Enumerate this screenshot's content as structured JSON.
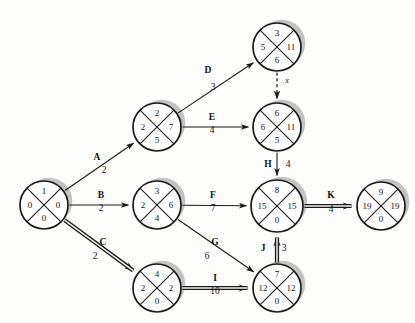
{
  "diagram": {
    "colors": {
      "line": "#1a1a1a",
      "shadow": "#b9b9b9",
      "background": "#fdfdfc",
      "critical": "#3a3a3a"
    },
    "nodes": [
      {
        "id": "1",
        "cx": 44,
        "cy": 205,
        "r": 24,
        "top": "1",
        "left": "0",
        "right": "0",
        "bottom": "0"
      },
      {
        "id": "2",
        "cx": 157,
        "cy": 127,
        "r": 24,
        "top": "2",
        "left": "2",
        "right": "7",
        "bottom": "5"
      },
      {
        "id": "3",
        "cx": 157,
        "cy": 205,
        "r": 24,
        "top": "3",
        "left": "2",
        "right": "6",
        "bottom": "4"
      },
      {
        "id": "4",
        "cx": 157,
        "cy": 288,
        "r": 24,
        "top": "4",
        "left": "2",
        "right": "2",
        "bottom": "0"
      },
      {
        "id": "5",
        "cx": 277,
        "cy": 47,
        "r": 24,
        "top": "3",
        "left": "5",
        "right": "11",
        "bottom": "6"
      },
      {
        "id": "6",
        "cx": 277,
        "cy": 127,
        "r": 24,
        "top": "6",
        "left": "6",
        "right": "11",
        "bottom": "5"
      },
      {
        "id": "8",
        "cx": 277,
        "cy": 206,
        "r": 26,
        "top": "8",
        "left": "15",
        "right": "15",
        "bottom": "0"
      },
      {
        "id": "7",
        "cx": 277,
        "cy": 288,
        "r": 24,
        "top": "7",
        "left": "12",
        "right": "12",
        "bottom": "0"
      },
      {
        "id": "9",
        "cx": 381,
        "cy": 206,
        "r": 24,
        "top": "9",
        "left": "19",
        "right": "19",
        "bottom": "0"
      }
    ],
    "edges": [
      {
        "id": "A",
        "label": "A",
        "duration": "2",
        "from": "1",
        "to": "2",
        "style": "thin",
        "label_x": 97,
        "label_y": 158,
        "dur_x": 104,
        "dur_y": 171
      },
      {
        "id": "B",
        "label": "B",
        "duration": "2",
        "from": "1",
        "to": "3",
        "style": "thin",
        "label_x": 101,
        "label_y": 196,
        "dur_x": 101,
        "dur_y": 209
      },
      {
        "id": "C",
        "label": "C",
        "duration": "2",
        "from": "1",
        "to": "4",
        "style": "critical",
        "label_x": 103,
        "label_y": 243,
        "dur_x": 95,
        "dur_y": 257
      },
      {
        "id": "D",
        "label": "D",
        "duration": "3",
        "from": "2",
        "to": "5",
        "style": "thin",
        "label_x": 208,
        "label_y": 71,
        "dur_x": 213,
        "dur_y": 88
      },
      {
        "id": "E",
        "label": "E",
        "duration": "4",
        "from": "2",
        "to": "6",
        "style": "thin",
        "label_x": 212,
        "label_y": 118,
        "dur_x": 212,
        "dur_y": 131
      },
      {
        "id": "x",
        "label": "x",
        "duration": "",
        "from": "5",
        "to": "6",
        "style": "dashed",
        "label_x": 287,
        "label_y": 82,
        "dur_x": 0,
        "dur_y": 0
      },
      {
        "id": "F",
        "label": "F",
        "duration": "7",
        "from": "3",
        "to": "8",
        "style": "thin",
        "label_x": 213,
        "label_y": 196,
        "dur_x": 213,
        "dur_y": 209
      },
      {
        "id": "G",
        "label": "G",
        "duration": "6",
        "from": "3",
        "to": "7",
        "style": "thin",
        "label_x": 215,
        "label_y": 243,
        "dur_x": 207,
        "dur_y": 257
      },
      {
        "id": "I",
        "label": "I",
        "duration": "10",
        "from": "4",
        "to": "7",
        "style": "critical",
        "label_x": 215,
        "label_y": 279,
        "dur_x": 215,
        "dur_y": 292
      },
      {
        "id": "H",
        "label": "H",
        "duration": "4",
        "from": "6",
        "to": "8",
        "style": "thin",
        "label_x": 268,
        "label_y": 165,
        "dur_x": 288,
        "dur_y": 165
      },
      {
        "id": "J",
        "label": "J",
        "duration": "3",
        "from": "7",
        "to": "8",
        "style": "critical",
        "label_x": 263,
        "label_y": 249,
        "dur_x": 284,
        "dur_y": 249
      },
      {
        "id": "K",
        "label": "K",
        "duration": "4",
        "from": "8",
        "to": "9",
        "style": "critical",
        "label_x": 331,
        "label_y": 196,
        "dur_x": 331,
        "dur_y": 210
      }
    ]
  }
}
